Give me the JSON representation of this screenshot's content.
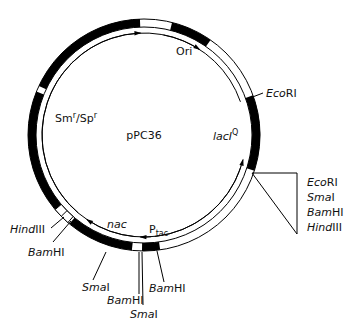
{
  "plasmid": {
    "name": "pPC36",
    "center": [
      144,
      135
    ],
    "r_outer": 116,
    "r_inner": 108,
    "r_track": 102,
    "colors": {
      "ink": "#000000",
      "background": "#ffffff"
    }
  },
  "segments": [
    {
      "name": "smr-spr-upper",
      "start": 205,
      "end": 268,
      "fill": "black"
    },
    {
      "name": "smr-spr-lower",
      "start": 140,
      "end": 202,
      "fill": "black"
    },
    {
      "name": "nac",
      "start": 96,
      "end": 130,
      "fill": "black"
    },
    {
      "name": "ptac",
      "start": 82,
      "end": 91,
      "fill": "black"
    },
    {
      "name": "ori",
      "start": 284,
      "end": 305,
      "fill": "black"
    },
    {
      "name": "laciq",
      "start": 340,
      "end": 18,
      "fill": "black"
    }
  ],
  "labels": {
    "plasmid_name": "pPC36",
    "ori": "Ori",
    "smr_spr": {
      "sm": "Sm",
      "sup1": "r",
      "slash": "/Sp",
      "sup2": "r"
    },
    "laciq": {
      "main": "lacI",
      "sup": "Q"
    },
    "nac": "nac",
    "ptac": {
      "main": "P",
      "sub": "tac"
    },
    "ecori_top": {
      "italic": "Eco",
      "roman": "RI"
    },
    "mcs": [
      {
        "italic": "Eco",
        "roman": "RI"
      },
      {
        "italic": "Sma",
        "roman": "I"
      },
      {
        "italic": "Bam",
        "roman": "HI"
      },
      {
        "italic": "Hind",
        "roman": "III"
      }
    ],
    "hindiii_left": {
      "italic": "Hind",
      "roman": "III"
    },
    "bamhi_left": {
      "italic": "Bam",
      "roman": "HI"
    },
    "smai_bottom_left": {
      "italic": "Sma",
      "roman": "I"
    },
    "bamhi_bottom_mid": {
      "italic": "Bam",
      "roman": "HI"
    },
    "smai_bottom_mid": {
      "italic": "Sma",
      "roman": "I"
    },
    "bamhi_bottom_right": {
      "italic": "Bam",
      "roman": "HI"
    }
  }
}
